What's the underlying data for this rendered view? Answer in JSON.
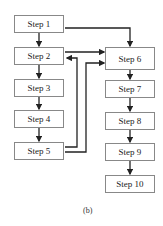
{
  "left_steps": [
    {
      "label": "Step 1"
    },
    {
      "label": "Step 2"
    },
    {
      "label": "Step 3"
    },
    {
      "label": "Step 4"
    },
    {
      "label": "Step 5"
    }
  ],
  "right_steps": [
    {
      "label": "Step 6"
    },
    {
      "label": "Step 7"
    },
    {
      "label": "Step 8"
    },
    {
      "label": "Step 9"
    },
    {
      "label": "Step 10"
    }
  ],
  "caption": "(b)"
}
